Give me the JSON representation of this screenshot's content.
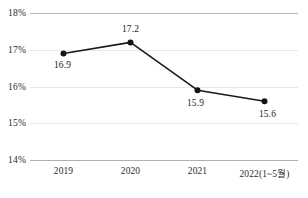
{
  "chart_data": {
    "type": "line",
    "title": "",
    "subtitle": "",
    "xlabel": "",
    "ylabel": "",
    "categories": [
      "2019",
      "2020",
      "2021",
      "2022(1~5월)"
    ],
    "values": [
      16.9,
      17.2,
      15.9,
      15.6
    ],
    "point_labels": [
      "16.9",
      "17.2",
      "15.9",
      "15.6"
    ],
    "ylim": [
      14,
      18
    ],
    "yticks": [
      18,
      17,
      16,
      15,
      14
    ],
    "ytick_labels": [
      "18%",
      "17%",
      "16%",
      "15%",
      "14%"
    ],
    "unit": "%",
    "grid": true,
    "legend": false,
    "series": [
      {
        "name": "",
        "values": [
          16.9,
          17.2,
          15.9,
          15.6
        ],
        "color": "#1a1a1a",
        "marker": "circle"
      }
    ],
    "colors": {
      "line": "#1a1a1a",
      "marker": "#141414",
      "gridline": "#e8e8e8",
      "axis": "#b0b0b0",
      "text": "#2b2b2b",
      "background": "#ffffff"
    },
    "label_offsets": [
      {
        "dx": -1,
        "dy": 17
      },
      {
        "dx": 0,
        "dy": -8
      },
      {
        "dx": -2,
        "dy": 18
      },
      {
        "dx": 3,
        "dy": 18
      }
    ]
  }
}
